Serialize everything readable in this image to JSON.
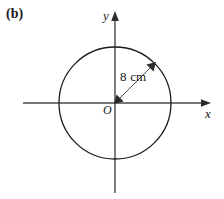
{
  "figure": {
    "part_label": "(b)",
    "axes": {
      "x_label": "x",
      "y_label": "y",
      "origin_label": "O"
    },
    "annotations": {
      "radius_label": "8 cm"
    },
    "colors": {
      "ink": "#1a1a1a",
      "axis": "#4a4a4a",
      "background": "#ffffff"
    },
    "geometry": {
      "center_x": 115,
      "center_y": 103,
      "radius_px": 56,
      "radius_value": 8,
      "radius_unit": "cm"
    }
  }
}
